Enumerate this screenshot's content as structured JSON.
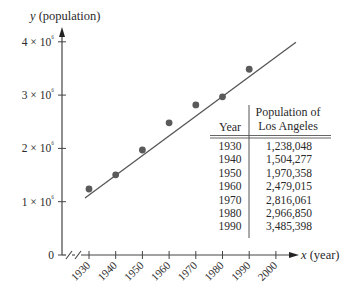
{
  "chart_data": {
    "type": "scatter",
    "title": "",
    "xlabel": "x (year)",
    "ylabel": "y (population)",
    "x": [
      1930,
      1940,
      1950,
      1960,
      1970,
      1980,
      1990
    ],
    "y": [
      1238048,
      1504277,
      1970358,
      2479015,
      2816061,
      2966850,
      3485398
    ],
    "series": [
      {
        "name": "Population of Los Angeles",
        "kind": "points",
        "x": [
          1930,
          1940,
          1950,
          1960,
          1970,
          1980,
          1990
        ],
        "values": [
          1238048,
          1504277,
          1970358,
          2479015,
          2816061,
          2966850,
          3485398
        ]
      },
      {
        "name": "Linear fit",
        "kind": "line",
        "x": [
          1928.5,
          2007.5
        ],
        "values": [
          1070000,
          3990000
        ]
      }
    ],
    "x_ticks": [
      "1930",
      "1940",
      "1950",
      "1960",
      "1970",
      "1980",
      "1990",
      "2000"
    ],
    "y_ticks": [
      "0",
      "1 × 10⁶",
      "2 × 10⁶",
      "3 × 10⁶",
      "4 × 10⁶"
    ],
    "xlim": [
      1920,
      2010
    ],
    "ylim": [
      0,
      4000000
    ],
    "axis_break": "x",
    "grid": false,
    "legend": "none",
    "table": {
      "headers": {
        "year": "Year",
        "population_line1": "Population of",
        "population_line2": "Los Angeles"
      },
      "rows": [
        {
          "year": "1930",
          "population": "1,238,048"
        },
        {
          "year": "1940",
          "population": "1,504,277"
        },
        {
          "year": "1950",
          "population": "1,970,358"
        },
        {
          "year": "1960",
          "population": "2,479,015"
        },
        {
          "year": "1970",
          "population": "2,816,061"
        },
        {
          "year": "1980",
          "population": "2,966,850"
        },
        {
          "year": "1990",
          "population": "3,485,398"
        }
      ]
    }
  },
  "colors": {
    "axis": "#444444",
    "points": "#5a5a5a",
    "fit_line": "#555555",
    "text": "#2a2a2a"
  }
}
